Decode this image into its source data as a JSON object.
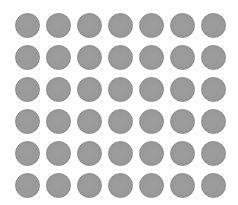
{
  "grid": {
    "rows": 6,
    "cols": 7,
    "origin_x": 15,
    "origin_y": 13,
    "pitch_x": 31,
    "pitch_y": 32,
    "diameter": 25,
    "fill_color": "#999999",
    "border_color": "#888888",
    "background_color": "#ffffff"
  }
}
